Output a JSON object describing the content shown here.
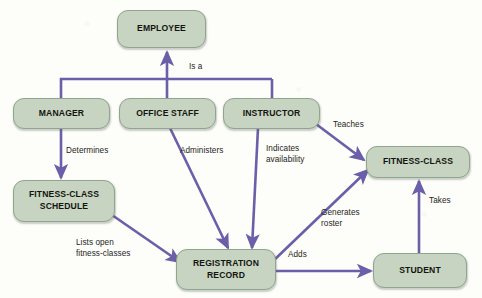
{
  "diagram": {
    "type": "entity-relationship-diagram",
    "title": "",
    "colors": {
      "node_fill": "#c6d4c1",
      "node_border": "#8fa58d",
      "arrow": "#6a5fa8",
      "background": "#fdfdfa",
      "text": "#14130f"
    },
    "nodes": [
      {
        "id": "employee",
        "label": "EMPLOYEE"
      },
      {
        "id": "manager",
        "label": "MANAGER"
      },
      {
        "id": "office-staff",
        "label": "OFFICE STAFF"
      },
      {
        "id": "instructor",
        "label": "INSTRUCTOR"
      },
      {
        "id": "fitness-class-schedule",
        "label": "FITNESS-CLASS\nSCHEDULE"
      },
      {
        "id": "registration-record",
        "label": "REGISTRATION\nRECORD"
      },
      {
        "id": "fitness-class",
        "label": "FITNESS-CLASS"
      },
      {
        "id": "student",
        "label": "STUDENT"
      }
    ],
    "edge_labels": [
      {
        "id": "is-a",
        "text": "Is a"
      },
      {
        "id": "determines",
        "text": "Determines"
      },
      {
        "id": "administers",
        "text": "Administers"
      },
      {
        "id": "indicates-availability",
        "text": "Indicates\navailability"
      },
      {
        "id": "teaches",
        "text": "Teaches"
      },
      {
        "id": "lists-open-fitness-classes",
        "text": "Lists open\nfitness-classes"
      },
      {
        "id": "generates-roster",
        "text": "Generates\nroster"
      },
      {
        "id": "adds",
        "text": "Adds"
      },
      {
        "id": "takes",
        "text": "Takes"
      }
    ],
    "relationships": [
      {
        "from": "manager",
        "to": "employee",
        "label": "Is a"
      },
      {
        "from": "office-staff",
        "to": "employee",
        "label": "Is a"
      },
      {
        "from": "instructor",
        "to": "employee",
        "label": "Is a"
      },
      {
        "from": "manager",
        "to": "fitness-class-schedule",
        "label": "Determines"
      },
      {
        "from": "office-staff",
        "to": "registration-record",
        "label": "Administers"
      },
      {
        "from": "instructor",
        "to": "registration-record",
        "label": "Indicates availability"
      },
      {
        "from": "instructor",
        "to": "fitness-class",
        "label": "Teaches"
      },
      {
        "from": "fitness-class-schedule",
        "to": "registration-record",
        "label": "Lists open fitness-classes"
      },
      {
        "from": "registration-record",
        "to": "fitness-class",
        "label": "Generates roster"
      },
      {
        "from": "registration-record",
        "to": "student",
        "label": "Adds"
      },
      {
        "from": "student",
        "to": "fitness-class",
        "label": "Takes"
      }
    ]
  }
}
